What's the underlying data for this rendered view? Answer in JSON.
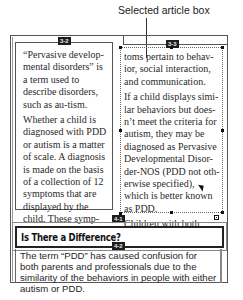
{
  "callout": {
    "label": "Selected article box"
  },
  "frame_labels": {
    "box_3_2": "3-2",
    "box_3_3": "3-3",
    "box_4_1": "4-1",
    "box_4_2": "4-2"
  },
  "article_left": {
    "paragraphs": [
      "“Pervasive develop-mental disorders” is a term used to describe disorders, such as au-tism.",
      "Whether a child is diagnosed with PDD or autism is a matter of scale. A diagnosis is made on the basis of a collection of 12 symptoms that are displayed by the child. These symp-"
    ]
  },
  "article_right": {
    "paragraphs": [
      "toms pertain to behav-ior, social interaction, and communication.",
      "If a child displays simi-lar behaviors but does-n’t meet the criteria for autism, they may be diagnosed as Pervasive Developmental Disor-der-NOS (PDD not oth-erwise specified), which is better known as PDD.",
      "Children with both"
    ]
  },
  "headline": {
    "text": "Is There a Difference?"
  },
  "body_story": {
    "text": "The term “PDD” has caused confusion for both parents and professionals due to the similarity of the behaviors in people with either autism or PDD."
  },
  "colors": {
    "frame": "#555555",
    "label_bg": "#1c1c1c",
    "label_fg": "#e8e8e8"
  }
}
